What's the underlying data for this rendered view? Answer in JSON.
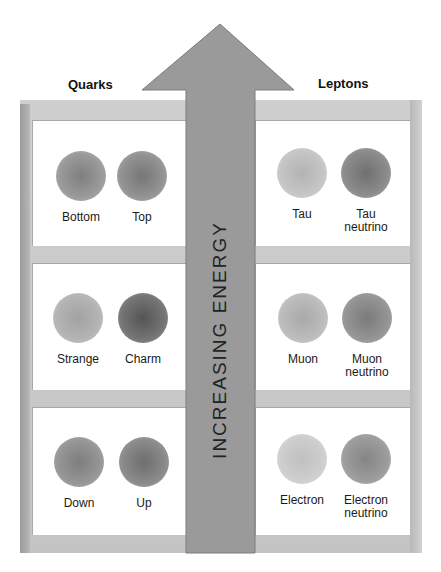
{
  "columns": {
    "left_title": "Quarks",
    "right_title": "Leptons"
  },
  "arrow": {
    "label": "INCREASING ENERGY",
    "color": "#9a9a9a"
  },
  "rows": [
    {
      "left": [
        {
          "name": "Bottom",
          "line2": "",
          "shade": "#8e8e8e"
        },
        {
          "name": "Top",
          "line2": "",
          "shade": "#858585"
        }
      ],
      "right": [
        {
          "name": "Tau",
          "line2": "",
          "shade": "#bdbdbd"
        },
        {
          "name": "Tau",
          "line2": "neutrino",
          "shade": "#7e7e7e"
        }
      ]
    },
    {
      "left": [
        {
          "name": "Strange",
          "line2": "",
          "shade": "#adadad"
        },
        {
          "name": "Charm",
          "line2": "",
          "shade": "#6a6a6a"
        }
      ],
      "right": [
        {
          "name": "Muon",
          "line2": "",
          "shade": "#b4b4b4"
        },
        {
          "name": "Muon",
          "line2": "neutrino",
          "shade": "#8a8a8a"
        }
      ]
    },
    {
      "left": [
        {
          "name": "Down",
          "line2": "",
          "shade": "#8c8c8c"
        },
        {
          "name": "Up",
          "line2": "",
          "shade": "#7d7d7d"
        }
      ],
      "right": [
        {
          "name": "Electron",
          "line2": "",
          "shade": "#c8c8c8"
        },
        {
          "name": "Electron",
          "line2": "neutrino",
          "shade": "#939393"
        }
      ]
    }
  ]
}
